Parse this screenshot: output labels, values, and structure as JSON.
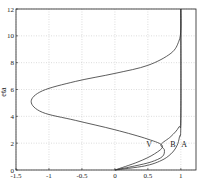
{
  "chart_data": {
    "type": "line",
    "title": "",
    "xlabel": "",
    "ylabel": "eta",
    "xlim": [
      -1.5,
      1.23
    ],
    "ylim": [
      0,
      12
    ],
    "grid": true,
    "xticks": [
      "-1.5",
      "-1",
      "-0.5",
      "0",
      "0.5",
      "1"
    ],
    "yticks": [
      "0",
      "2",
      "4",
      "6",
      "8",
      "10",
      "12"
    ],
    "series": [
      {
        "name": "A",
        "x": [
          0,
          0.45,
          0.7,
          0.85,
          0.94,
          0.98,
          1.0,
          1.0
        ],
        "y": [
          0,
          0.3,
          0.7,
          1.2,
          1.8,
          2.5,
          3.5,
          12
        ]
      },
      {
        "name": "B",
        "x": [
          0,
          0.3,
          0.55,
          0.72,
          0.75,
          0.7,
          0.85,
          0.97,
          1.0,
          1.0
        ],
        "y": [
          0,
          0.3,
          0.6,
          1.0,
          1.5,
          1.9,
          2.5,
          3.2,
          4.0,
          12
        ]
      },
      {
        "name": "V",
        "x": [
          0,
          0.35,
          0.6,
          0.72,
          0.5,
          0.0,
          -0.6,
          -1.1,
          -1.27,
          -1.1,
          -0.6,
          0.0,
          0.5,
          0.85,
          0.97,
          1.0,
          1.0
        ],
        "y": [
          0,
          0.6,
          1.2,
          1.8,
          2.3,
          3.0,
          3.7,
          4.3,
          5.1,
          5.9,
          6.6,
          7.2,
          7.8,
          8.7,
          9.6,
          10.5,
          12
        ]
      }
    ],
    "annotations": [
      {
        "text": "V",
        "x": 0.52,
        "y": 1.95
      },
      {
        "text": "B",
        "x": 0.88,
        "y": 1.95
      },
      {
        "text": "A",
        "x": 1.05,
        "y": 1.95
      }
    ]
  }
}
